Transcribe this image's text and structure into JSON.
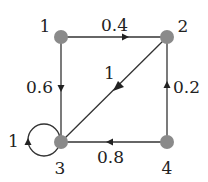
{
  "diagram": {
    "type": "directed-weighted-graph",
    "colors": {
      "edge": "#333333",
      "node": "#8a8a8a",
      "label": "#222222"
    },
    "nodes": [
      {
        "id": "1",
        "label": "1",
        "x": 61,
        "y": 37,
        "label_x": 40,
        "label_y": 32
      },
      {
        "id": "2",
        "label": "2",
        "x": 167,
        "y": 37,
        "label_x": 178,
        "label_y": 32
      },
      {
        "id": "3",
        "label": "3",
        "x": 61,
        "y": 142,
        "label_x": 60,
        "label_y": 170
      },
      {
        "id": "4",
        "label": "4",
        "x": 167,
        "y": 142,
        "label_x": 167,
        "label_y": 170
      }
    ],
    "edges": [
      {
        "from": "1",
        "to": "2",
        "weight": "0.4"
      },
      {
        "from": "1",
        "to": "3",
        "weight": "0.6"
      },
      {
        "from": "2",
        "to": "3",
        "weight": "1"
      },
      {
        "from": "4",
        "to": "2",
        "weight": "0.2"
      },
      {
        "from": "4",
        "to": "3",
        "weight": "0.8"
      },
      {
        "from": "3",
        "to": "3",
        "weight": "1"
      }
    ]
  }
}
